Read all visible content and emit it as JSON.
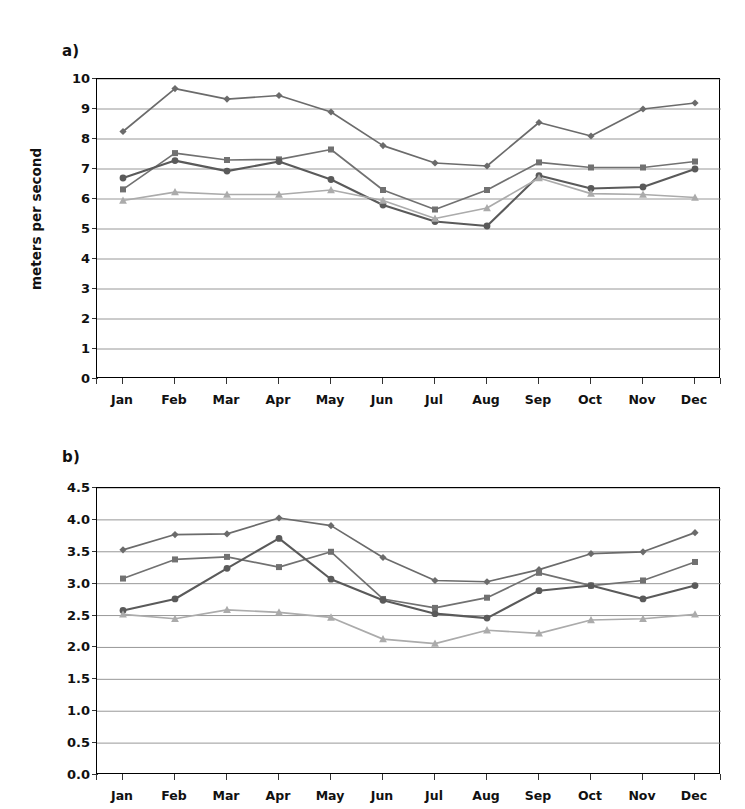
{
  "figure": {
    "panels": [
      {
        "key": "a",
        "label": "a)",
        "ylabel": "meters per second"
      },
      {
        "key": "b",
        "label": "b)",
        "ylabel": "meters per second"
      }
    ]
  },
  "colors": {
    "series_diamond": "#6b6b6b",
    "series_square": "#717171",
    "series_circle": "#5a5a5a",
    "series_triangle": "#ababab",
    "gridline": "#8c8c8c",
    "axis": "#000000",
    "text": "#111111",
    "background": "#ffffff"
  },
  "chart_data": [
    {
      "type": "line",
      "panel": "a",
      "title": "a)",
      "xlabel": "",
      "ylabel": "meters per second",
      "ylim": [
        0,
        10
      ],
      "yticks": [
        "0",
        "1",
        "2",
        "3",
        "4",
        "5",
        "6",
        "7",
        "8",
        "9",
        "10"
      ],
      "ytick_values": [
        0,
        1,
        2,
        3,
        4,
        5,
        6,
        7,
        8,
        9,
        10
      ],
      "grid": true,
      "legend": "none",
      "categories": [
        "Jan",
        "Feb",
        "Mar",
        "Apr",
        "May",
        "Jun",
        "Jul",
        "Aug",
        "Sep",
        "Oct",
        "Nov",
        "Dec"
      ],
      "series": [
        {
          "name": "series-1",
          "marker": "diamond",
          "color": "#6b6b6b",
          "values": [
            8.25,
            9.68,
            9.33,
            9.45,
            8.9,
            7.78,
            7.2,
            7.1,
            8.55,
            8.1,
            9.0,
            9.2
          ]
        },
        {
          "name": "series-2",
          "marker": "square",
          "color": "#717171",
          "values": [
            6.32,
            7.53,
            7.3,
            7.32,
            7.65,
            6.3,
            5.65,
            6.3,
            7.22,
            7.05,
            7.05,
            7.25
          ]
        },
        {
          "name": "series-3",
          "marker": "circle",
          "color": "#5a5a5a",
          "values": [
            6.7,
            7.28,
            6.93,
            7.25,
            6.65,
            5.8,
            5.25,
            5.1,
            6.78,
            6.35,
            6.4,
            7.0
          ]
        },
        {
          "name": "series-4",
          "marker": "triangle",
          "color": "#ababab",
          "values": [
            5.95,
            6.23,
            6.15,
            6.15,
            6.3,
            5.95,
            5.35,
            5.7,
            6.7,
            6.18,
            6.15,
            6.05
          ]
        }
      ]
    },
    {
      "type": "line",
      "panel": "b",
      "title": "b)",
      "xlabel": "",
      "ylabel": "meters per second",
      "ylim": [
        0.0,
        4.5
      ],
      "yticks": [
        "0.0",
        "0.5",
        "1.0",
        "1.5",
        "2.0",
        "2.5",
        "3.0",
        "3.5",
        "4.0",
        "4.5"
      ],
      "ytick_values": [
        0.0,
        0.5,
        1.0,
        1.5,
        2.0,
        2.5,
        3.0,
        3.5,
        4.0,
        4.5
      ],
      "grid": true,
      "legend": "none",
      "categories": [
        "Jan",
        "Feb",
        "Mar",
        "Apr",
        "May",
        "Jun",
        "Jul",
        "Aug",
        "Sep",
        "Oct",
        "Nov",
        "Dec"
      ],
      "series": [
        {
          "name": "series-1",
          "marker": "diamond",
          "color": "#6b6b6b",
          "values": [
            3.53,
            3.77,
            3.78,
            4.03,
            3.91,
            3.41,
            3.05,
            3.03,
            3.22,
            3.47,
            3.5,
            3.8
          ]
        },
        {
          "name": "series-2",
          "marker": "square",
          "color": "#717171",
          "values": [
            3.08,
            3.38,
            3.42,
            3.26,
            3.5,
            2.76,
            2.62,
            2.78,
            3.17,
            2.97,
            3.05,
            3.34
          ]
        },
        {
          "name": "series-3",
          "marker": "circle",
          "color": "#5a5a5a",
          "values": [
            2.58,
            2.76,
            3.24,
            3.71,
            3.07,
            2.74,
            2.53,
            2.46,
            2.89,
            2.97,
            2.76,
            2.97
          ]
        },
        {
          "name": "series-4",
          "marker": "triangle",
          "color": "#ababab",
          "values": [
            2.52,
            2.45,
            2.59,
            2.55,
            2.47,
            2.13,
            2.06,
            2.27,
            2.22,
            2.43,
            2.45,
            2.52
          ]
        }
      ]
    }
  ]
}
